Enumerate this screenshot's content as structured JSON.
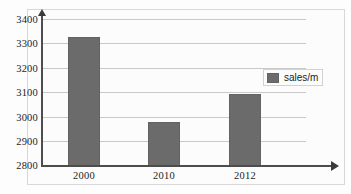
{
  "chart_data": {
    "type": "bar",
    "title": "",
    "xlabel": "",
    "ylabel": "",
    "categories": [
      "2000",
      "2010",
      "2012"
    ],
    "series": [
      {
        "name": "sales/m",
        "values": [
          3325,
          2980,
          3092
        ],
        "color": "#6b6b6b"
      }
    ],
    "ylim": [
      2800,
      3400
    ],
    "ytick_step": 100,
    "yticks": [
      2800,
      2900,
      3000,
      3100,
      3200,
      3300,
      3400
    ],
    "ytick_labels": [
      "2800",
      "2900",
      "3000",
      "3100",
      "3200",
      "3300",
      "3400"
    ],
    "grid": true,
    "grid_axis": "y",
    "legend": {
      "position": "upper-right-inside",
      "entries": [
        {
          "label": "sales/m",
          "color": "#6b6b6b"
        }
      ]
    },
    "axis_arrows": {
      "y_top": true,
      "x_right": true
    }
  },
  "colors": {
    "bar_fill": "#6b6b6b",
    "bar_border": "#636363",
    "gridline": "#c9c9c9",
    "axis": "#4d4d4d",
    "frame": "#d8d8d8",
    "background": "#fcfcfc",
    "text": "#1c1c1c"
  }
}
